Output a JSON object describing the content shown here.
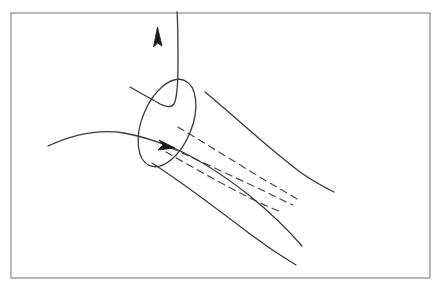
{
  "figure": {
    "background_color": "#ffffff",
    "ink_color": "#3a3a3a",
    "frame": {
      "name": "figure-border",
      "color": "#8a8a8a",
      "stroke_width": 1.2,
      "x": 11,
      "y": 13,
      "width": 419,
      "height": 265
    },
    "elements": {
      "ellipse_mouth": {
        "label": "circular cross-section opening",
        "color": "#3a3a3a",
        "stroke_width": 1.3,
        "center_x": 167,
        "center_y": 123,
        "radius_x": 25,
        "radius_y": 46,
        "rotation_deg": 22
      },
      "tube_upper_edge": {
        "label": "upper generator of flaring tube",
        "color": "#3a3a3a",
        "stroke_width": 1.3,
        "start_x": 205,
        "start_y": 92,
        "end_x": 334,
        "end_y": 192
      },
      "tube_lower_edge": {
        "label": "lower generator of flaring tube",
        "color": "#3a3a3a",
        "stroke_width": 1.3,
        "start_x": 152,
        "start_y": 163,
        "end_x": 296,
        "end_y": 265
      },
      "dashed_lines": {
        "label": "interior axis and hidden generators",
        "count": 3,
        "color": "#4a4a4a",
        "stroke_width": 1.2,
        "dash_pattern": "7 5"
      },
      "through_curve": {
        "label": "curve entering from the left through the opening",
        "color": "#3a3a3a",
        "stroke_width": 1.3,
        "start_x": 48,
        "start_y": 146,
        "arrow_x": 172,
        "arrow_y": 146
      },
      "outgoing_curve": {
        "label": "curve exiting upward out of the opening",
        "color": "#3a3a3a",
        "stroke_width": 1.3,
        "arrow_tip_x": 158,
        "arrow_tip_y": 27,
        "base_x": 200,
        "base_y": 130
      },
      "arrowhead_up": {
        "label": "upward vector arrowhead",
        "color": "#1a1a1a"
      },
      "arrowhead_right": {
        "label": "rightward flow arrowhead at opening center",
        "color": "#1a1a1a"
      }
    }
  }
}
